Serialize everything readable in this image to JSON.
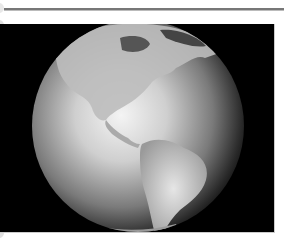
{
  "image": {
    "subject": "Earth globe showing North and South America",
    "style": "grayscale",
    "background_color": "#000000"
  },
  "icons": {
    "globe": "globe-image"
  }
}
